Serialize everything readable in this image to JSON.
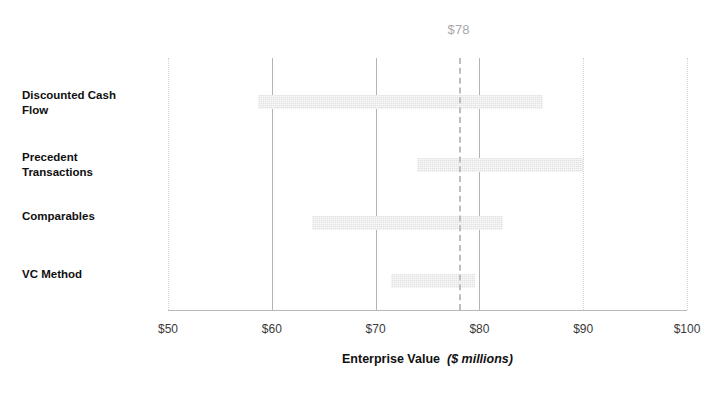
{
  "chart_data": {
    "type": "bar",
    "subtype": "football-field-range",
    "title": "",
    "xlabel": "Enterprise Value",
    "xlabel_units": "($ millions)",
    "ylabel": "",
    "xlim": [
      50,
      100
    ],
    "xticks": [
      50,
      60,
      70,
      80,
      90,
      100
    ],
    "xtick_labels": [
      "$50",
      "$60",
      "$70",
      "$80",
      "$90",
      "$100"
    ],
    "grid": true,
    "gridlines_solid": [
      60,
      70,
      80
    ],
    "gridlines_dotted": [
      50,
      90,
      100
    ],
    "legend": "none",
    "categories": [
      "Discounted Cash Flow",
      "Precedent Transactions",
      "Comparables",
      "VC Method"
    ],
    "ranges": [
      {
        "category": "Discounted Cash Flow",
        "low": 58.7,
        "high": 86.1
      },
      {
        "category": "Precedent Transactions",
        "low": 74.0,
        "high": 90.0
      },
      {
        "category": "Comparables",
        "low": 63.9,
        "high": 82.3
      },
      {
        "category": "VC Method",
        "low": 71.5,
        "high": 79.6
      }
    ],
    "annotations": [
      {
        "name": "target-value",
        "label": "$78",
        "value": 78,
        "style": "dashed-vertical-line"
      }
    ],
    "colors": {
      "bar_fill": "#e2e2e2",
      "gridline": "#b3b3b3",
      "gridline_light": "#d2d2d2",
      "axis": "#b9b9b9",
      "annotation_text": "#a8a8a8",
      "label_text": "#101010"
    }
  },
  "category_labels": [
    {
      "line1": "Discounted Cash",
      "line2": "Flow"
    },
    {
      "line1": "Precedent",
      "line2": "Transactions"
    },
    {
      "line1": "Comparables",
      "line2": ""
    },
    {
      "line1": "VC Method",
      "line2": ""
    }
  ]
}
